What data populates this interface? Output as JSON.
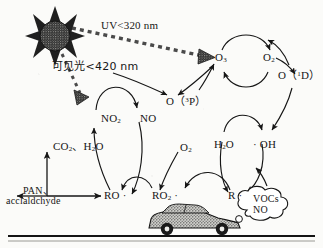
{
  "figure": {
    "kind": "photochemical-smog-mechanism-diagram",
    "background": "#fbfbf9",
    "ink": "#161616"
  },
  "light": {
    "uv_label": "UV<320 nm",
    "visible_label": "可见光<420 nm",
    "sun_icon": "sun-icon",
    "ray_icon": "light-ray-icon"
  },
  "species": {
    "o3_top": "O<sub>3</sub>",
    "o2_top": "O<sub>2</sub>",
    "o1d": "O（<sup>1</sup>D）",
    "o3p": "O（<sup>3</sup>P）",
    "no2": "NO<sub>2</sub>",
    "no": "NO",
    "h2o": "H<sub>2</sub>O",
    "oh": "· OH",
    "o2_mid": "O<sub>2</sub>",
    "ro": "RO ·",
    "ro2": "RO<sub>2</sub> ·",
    "r": "R ·",
    "co2_h2o": "CO<sub>2</sub>、H<sub>2</sub>O"
  },
  "products": {
    "pan_line1": "PAN、",
    "pan_line2": "acclaldchyde"
  },
  "emission": {
    "cloud_line1": "VOCs",
    "cloud_line2": "NO",
    "cloud_icon": "exhaust-plume-icon",
    "car_icon": "car-icon",
    "ground_icon": "ground-line-icon"
  }
}
